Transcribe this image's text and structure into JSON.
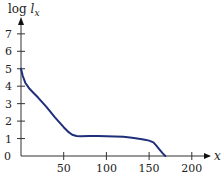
{
  "chart_data": {
    "type": "line",
    "title": "",
    "xlabel": "x",
    "ylabel_prefix": "log ",
    "ylabel_var": "l",
    "ylabel_sub": "x",
    "xlim": [
      0,
      215
    ],
    "ylim": [
      0,
      7.6
    ],
    "xticks": [
      50,
      100,
      150,
      200
    ],
    "xtick_labels": [
      "50",
      "100",
      "150",
      "200"
    ],
    "yticks": [
      0,
      1,
      2,
      3,
      4,
      5,
      6,
      7
    ],
    "ytick_labels": [
      "0",
      "1",
      "2",
      "3",
      "4",
      "5",
      "6",
      "7"
    ],
    "grid": false,
    "legend": "none",
    "colors": {
      "series": "#1f2f7a",
      "axis": "#333333"
    },
    "series": [
      {
        "name": "log l_x",
        "x": [
          0,
          2,
          5,
          10,
          15,
          20,
          30,
          40,
          50,
          55,
          60,
          65,
          70,
          80,
          90,
          100,
          110,
          120,
          130,
          140,
          145,
          150,
          155,
          158,
          162,
          166,
          169
        ],
        "y": [
          5.0,
          4.6,
          4.2,
          3.85,
          3.6,
          3.35,
          2.8,
          2.2,
          1.65,
          1.4,
          1.22,
          1.15,
          1.13,
          1.15,
          1.14,
          1.13,
          1.12,
          1.1,
          1.05,
          0.98,
          0.93,
          0.88,
          0.78,
          0.62,
          0.38,
          0.15,
          0.0
        ]
      }
    ]
  }
}
